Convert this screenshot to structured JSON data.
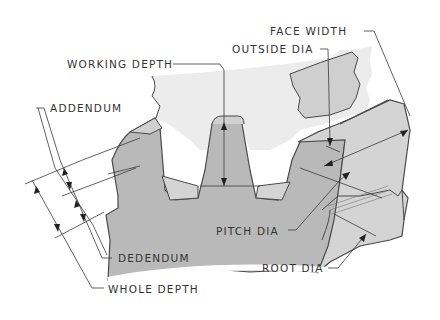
{
  "diagram": {
    "colors": {
      "gear_fill": "#b9b9b9",
      "gear_light": "#d6d6d6",
      "mating_gear": "#ececec",
      "outline": "#4a4a4a",
      "leader": "#3a3a3a",
      "text": "#333333"
    },
    "labels": {
      "working_depth": "WORKING DEPTH",
      "face_width": "FACE WIDTH",
      "outside_dia": "OUTSIDE DIA",
      "addendum": "ADDENDUM",
      "pitch_dia": "PITCH DIA",
      "dedendum": "DEDENDUM",
      "root_dia": "ROOT DIA",
      "whole_depth": "WHOLE DEPTH"
    }
  }
}
